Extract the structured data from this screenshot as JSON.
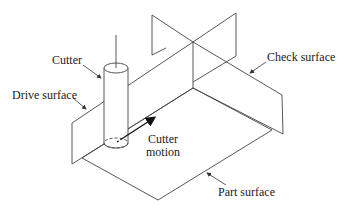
{
  "diagram": {
    "labels": {
      "cutter": "Cutter",
      "drive_surface": "Drive surface",
      "check_surface": "Check surface",
      "cutter_motion_line1": "Cutter",
      "cutter_motion_line2": "motion",
      "part_surface": "Part surface"
    },
    "colors": {
      "line": "#444444",
      "text": "#222222",
      "background": "#ffffff"
    }
  }
}
